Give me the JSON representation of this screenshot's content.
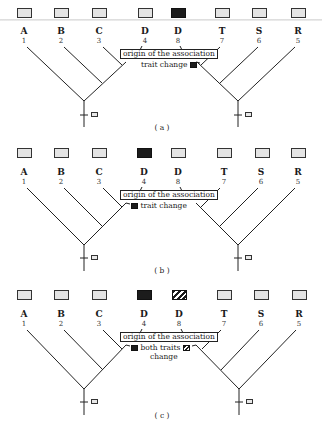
{
  "figure": {
    "taxa": [
      {
        "letter": "A",
        "number": "1"
      },
      {
        "letter": "B",
        "number": "2"
      },
      {
        "letter": "C",
        "number": "3"
      },
      {
        "letter": "D",
        "number": "4"
      },
      {
        "letter": "D",
        "number": "8"
      },
      {
        "letter": "T",
        "number": "7"
      },
      {
        "letter": "S",
        "number": "6"
      },
      {
        "letter": "R",
        "number": "5"
      }
    ],
    "trait_box_legend": {
      "stippled": "ancestral trait state",
      "black": "derived trait state (first trait)",
      "hatched": "derived trait state (second trait)"
    },
    "panels": [
      {
        "id": "a",
        "caption": "( a )",
        "box_states": [
          "stippled",
          "stippled",
          "stippled",
          "stippled",
          "black",
          "stippled",
          "stippled",
          "stippled"
        ],
        "origin_label": "origin of the association",
        "note": "trait change",
        "note_line2": "",
        "note_side": "right"
      },
      {
        "id": "b",
        "caption": "( b )",
        "box_states": [
          "stippled",
          "stippled",
          "stippled",
          "black",
          "stippled",
          "stippled",
          "stippled",
          "stippled"
        ],
        "origin_label": "origin of the association",
        "note": "trait change",
        "note_line2": "",
        "note_side": "left"
      },
      {
        "id": "c",
        "caption": "( c )",
        "box_states": [
          "stippled",
          "stippled",
          "stippled",
          "black",
          "hatched",
          "stippled",
          "stippled",
          "stippled"
        ],
        "origin_label": "origin of the association",
        "note": "both traits",
        "note_line2": "change",
        "note_side": "both"
      }
    ]
  }
}
